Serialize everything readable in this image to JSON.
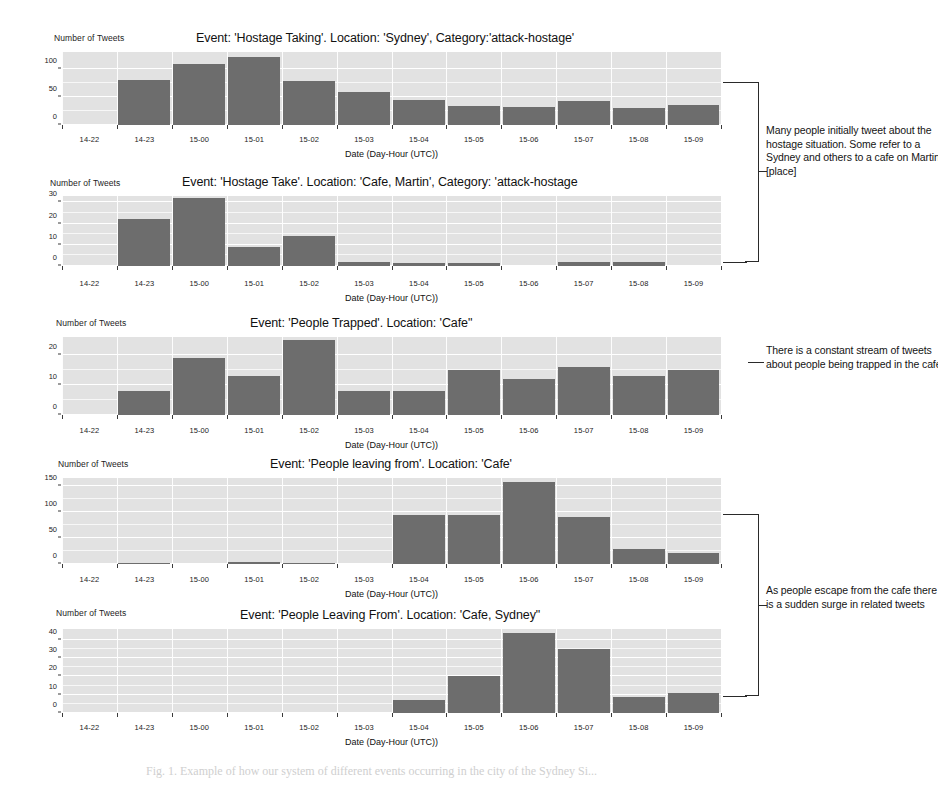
{
  "figure": {
    "caption": "Fig. 1.  Example of how our system of different events occurring in the city of the Sydney Si...",
    "axis_title": "Date (Day-Hour (UTC))",
    "y_axis_label": "Number of Tweets",
    "bar_color": "#6d6d6d",
    "plot_background": "#e2e2e2",
    "grid_color": "#ffffff"
  },
  "chart_data": [
    {
      "id": "chart-1",
      "type": "bar",
      "title": "Event: 'Hostage Taking'.  Location: 'Sydney', Category:'attack-hostage'",
      "ylabel": "Number of Tweets",
      "xlabel": "Date (Day-Hour (UTC))",
      "categories": [
        "14-22",
        "14-23",
        "15-00",
        "15-01",
        "15-02",
        "15-03",
        "15-04",
        "15-05",
        "15-06",
        "15-07",
        "15-08",
        "15-09"
      ],
      "values": [
        0,
        80,
        108,
        122,
        79,
        59,
        45,
        33,
        32,
        43,
        30,
        36
      ],
      "yticks": [
        0,
        50,
        100
      ],
      "ylim": [
        0,
        130
      ],
      "grid": true
    },
    {
      "id": "chart-2",
      "type": "bar",
      "title": "Event: 'Hostage Take'.  Location: 'Cafe, Martin', Category: 'attack-hostage",
      "ylabel": "Number of Tweets",
      "xlabel": "Date (Day-Hour (UTC))",
      "categories": [
        "14-22",
        "14-23",
        "15-00",
        "15-01",
        "15-02",
        "15-03",
        "15-04",
        "15-05",
        "15-06",
        "15-07",
        "15-08",
        "15-09"
      ],
      "values": [
        0,
        22,
        32,
        9,
        14,
        2,
        1.5,
        1.5,
        0,
        2,
        2,
        0
      ],
      "yticks": [
        0,
        10,
        20,
        30
      ],
      "ylim": [
        0,
        33
      ],
      "grid": true
    },
    {
      "id": "chart-3",
      "type": "bar",
      "title": "Event: 'People Trapped'.  Location: 'Cafe\"",
      "ylabel": "Number of Tweets",
      "xlabel": "Date (Day-Hour (UTC))",
      "categories": [
        "14-22",
        "14-23",
        "15-00",
        "15-01",
        "15-02",
        "15-03",
        "15-04",
        "15-05",
        "15-06",
        "15-07",
        "15-08",
        "15-09"
      ],
      "values": [
        0,
        8,
        19,
        13,
        25,
        8,
        8,
        15,
        12,
        16,
        13,
        15
      ],
      "yticks": [
        0,
        10,
        20
      ],
      "ylim": [
        0,
        26
      ],
      "grid": true
    },
    {
      "id": "chart-4",
      "type": "bar",
      "title": "Event: 'People leaving from'.  Location: 'Cafe'",
      "ylabel": "Number of Tweets",
      "xlabel": "Date (Day-Hour (UTC))",
      "categories": [
        "14-22",
        "14-23",
        "15-00",
        "15-01",
        "15-02",
        "15-03",
        "15-04",
        "15-05",
        "15-06",
        "15-07",
        "15-08",
        "15-09"
      ],
      "values": [
        0,
        2,
        0,
        3,
        2,
        0,
        94,
        94,
        158,
        90,
        28,
        22
      ],
      "yticks": [
        0,
        50,
        100,
        150
      ],
      "ylim": [
        0,
        165
      ],
      "grid": true
    },
    {
      "id": "chart-5",
      "type": "bar",
      "title": "Event: 'People Leaving From'.  Location: 'Cafe, Sydney\"",
      "ylabel": "Number of Tweets",
      "xlabel": "Date (Day-Hour (UTC))",
      "categories": [
        "14-22",
        "14-23",
        "15-00",
        "15-01",
        "15-02",
        "15-03",
        "15-04",
        "15-05",
        "15-06",
        "15-07",
        "15-08",
        "15-09"
      ],
      "values": [
        0,
        0,
        0,
        0,
        0,
        0,
        7,
        20,
        44,
        35,
        9,
        11
      ],
      "yticks": [
        0,
        10,
        20,
        30,
        40
      ],
      "ylim": [
        0,
        46
      ],
      "grid": true
    }
  ],
  "annotations": [
    {
      "id": "annotation-1",
      "text": "Many people initially tweet about the hostage situation. Some refer to a Sydney and others to a cafe on Martin [place]"
    },
    {
      "id": "annotation-2",
      "text": "There is a constant stream of tweets about people being trapped in the cafe"
    },
    {
      "id": "annotation-3",
      "text": "As people escape from the cafe there is a sudden surge in related tweets"
    }
  ]
}
